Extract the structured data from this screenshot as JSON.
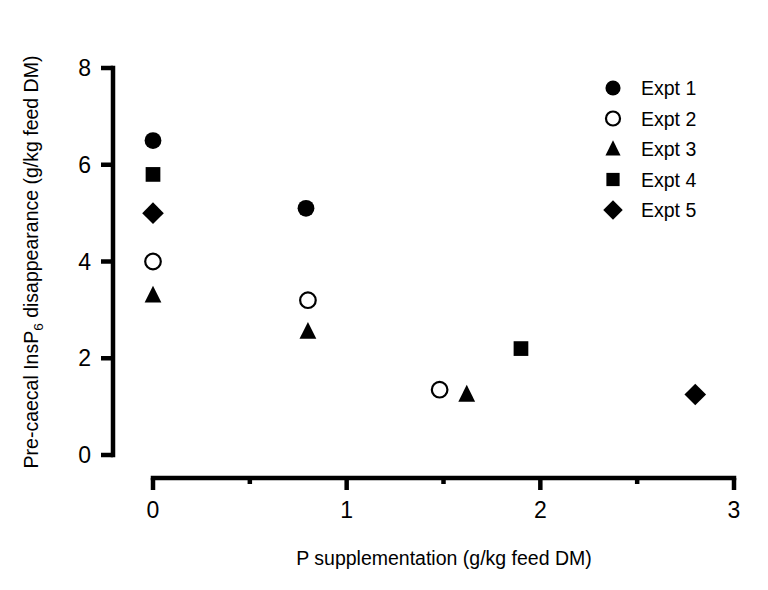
{
  "chart_data": {
    "type": "scatter",
    "title": "",
    "xlabel": "P supplementation (g/kg feed DM)",
    "ylabel": "Pre-caecal InsP6 disappearance (g/kg feed DM)",
    "ylabel_parts": {
      "pre": "Pre-caecal InsP",
      "sub": "6",
      "post": " disappearance (g/kg feed DM)"
    },
    "xlim": [
      0,
      3
    ],
    "ylim": [
      0,
      8
    ],
    "xticks": [
      0,
      1,
      2,
      3
    ],
    "xticklabels": [
      "0",
      "1",
      "2",
      "3"
    ],
    "xminorticks": [
      0.5,
      1.5,
      2.5
    ],
    "yticks": [
      0,
      2,
      4,
      6,
      8
    ],
    "yticklabels": [
      "0",
      "2",
      "4",
      "6",
      "8"
    ],
    "grid": false,
    "legend_position": "top-right",
    "marker_color": "#000000",
    "series": [
      {
        "name": "Expt 1",
        "marker": "circle-filled",
        "points": [
          {
            "x": 0.0,
            "y": 6.5
          },
          {
            "x": 0.79,
            "y": 5.1
          }
        ]
      },
      {
        "name": "Expt 2",
        "marker": "circle-open",
        "points": [
          {
            "x": 0.0,
            "y": 4.0
          },
          {
            "x": 0.8,
            "y": 3.2
          },
          {
            "x": 1.48,
            "y": 1.35
          }
        ]
      },
      {
        "name": "Expt 3",
        "marker": "triangle-filled",
        "points": [
          {
            "x": 0.0,
            "y": 3.3
          },
          {
            "x": 0.8,
            "y": 2.55
          },
          {
            "x": 1.62,
            "y": 1.25
          }
        ]
      },
      {
        "name": "Expt 4",
        "marker": "square-filled",
        "points": [
          {
            "x": 0.0,
            "y": 5.8
          },
          {
            "x": 1.9,
            "y": 2.2
          }
        ]
      },
      {
        "name": "Expt 5",
        "marker": "diamond-filled",
        "points": [
          {
            "x": 0.0,
            "y": 5.0
          },
          {
            "x": 2.8,
            "y": 1.25
          }
        ]
      }
    ]
  },
  "legend": {
    "entries": [
      {
        "label": "Expt 1",
        "marker": "circle-filled"
      },
      {
        "label": "Expt 2",
        "marker": "circle-open"
      },
      {
        "label": "Expt 3",
        "marker": "triangle-filled"
      },
      {
        "label": "Expt 4",
        "marker": "square-filled"
      },
      {
        "label": "Expt 5",
        "marker": "diamond-filled"
      }
    ]
  }
}
